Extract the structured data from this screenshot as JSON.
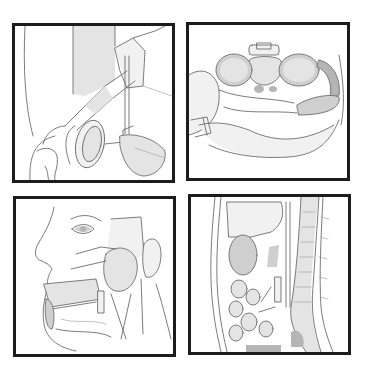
{
  "figure": {
    "layout": "2x2 grid of framed anatomical line illustrations",
    "frame_color": "#1c1c1c",
    "background": "#ffffff",
    "panels": [
      {
        "id": "p1",
        "subject": "abdominal viscera with transected bowel lumen and vessels (anterior view)"
      },
      {
        "id": "p2",
        "subject": "transverse cross-section of upper abdomen with vertebra, kidneys and spleen"
      },
      {
        "id": "p3",
        "subject": "lateral head and face dissection showing parotid region, mandible and neck vessels"
      },
      {
        "id": "p4",
        "subject": "sagittal section of trunk with spine, liver, bowel loops"
      }
    ]
  }
}
